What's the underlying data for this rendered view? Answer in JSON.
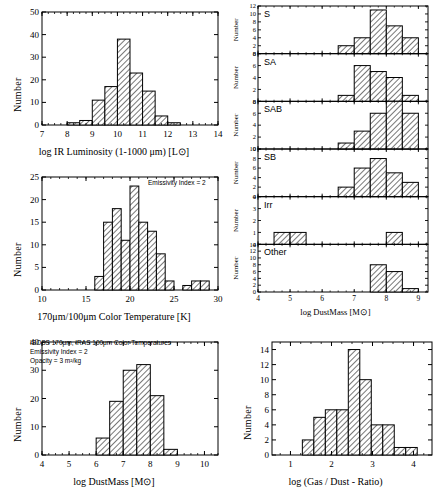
{
  "figure": {
    "background": "#ffffff",
    "ink": "#000000",
    "hatch": "diagonal-45"
  },
  "chart_data": [
    {
      "id": "ir-luminosity",
      "type": "bar",
      "title": "",
      "xlabel": "log  IR Luminosity (1-1000 μm) [L⊙]",
      "ylabel": "Number",
      "xlim": [
        7,
        14
      ],
      "ylim": [
        0,
        50
      ],
      "xticks": [
        7,
        8,
        9,
        10,
        11,
        12,
        13,
        14
      ],
      "yticks": [
        0,
        10,
        20,
        30,
        40,
        50
      ],
      "bin_width": 0.5,
      "bin_starts": [
        8.0,
        8.5,
        9.0,
        9.5,
        10.0,
        10.5,
        11.0,
        11.5,
        12.0
      ],
      "values": [
        1,
        2,
        11,
        17,
        38,
        23,
        15,
        4,
        1
      ],
      "grid": false,
      "annotations": []
    },
    {
      "id": "color-temperature",
      "type": "bar",
      "title": "",
      "xlabel": "170μm/100μm Color Temperature [K]",
      "ylabel": "Number",
      "xlim": [
        10,
        30
      ],
      "ylim": [
        0,
        25
      ],
      "xticks": [
        10,
        15,
        20,
        25,
        30
      ],
      "yticks": [
        0,
        5,
        10,
        15,
        20,
        25
      ],
      "bin_width": 1,
      "bin_starts": [
        16,
        17,
        18,
        19,
        20,
        21,
        22,
        23,
        24,
        25,
        26,
        27,
        28
      ],
      "values": [
        3,
        15,
        18,
        11,
        23,
        15,
        13,
        8,
        2,
        0,
        1,
        2,
        2
      ],
      "grid": false,
      "annotations": [
        "Emissivity Index = 2"
      ]
    },
    {
      "id": "dustmass-all",
      "type": "bar",
      "title": "",
      "xlabel": "log  DustMass  [M⊙]",
      "ylabel": "Number",
      "xlim": [
        4,
        10.5
      ],
      "ylim": [
        0,
        40
      ],
      "xticks": [
        4,
        5,
        6,
        7,
        8,
        9,
        10
      ],
      "yticks": [
        0,
        10,
        20,
        30,
        40
      ],
      "bin_width": 0.5,
      "bin_starts": [
        6.0,
        6.5,
        7.0,
        7.5,
        8.0,
        8.5
      ],
      "values": [
        6,
        19,
        30,
        32,
        21,
        2
      ],
      "grid": false,
      "annotations": [
        "ISOSS 170μm, IRAS 100μm Color Temperatures",
        "Emissivity Index = 2",
        "Opacity = 3 m²/kg"
      ]
    },
    {
      "id": "dustmass-by-type",
      "type": "bar",
      "xlabel": "log  DustMass  [M⊙]",
      "ylabel": "Number",
      "xlim": [
        4,
        9.3
      ],
      "xticks": [
        4,
        5,
        6,
        7,
        8,
        9
      ],
      "bin_width": 0.5,
      "grid": false,
      "subpanels": [
        {
          "label": "S",
          "ylim": [
            0,
            12
          ],
          "yticks": [
            0,
            2,
            4,
            6,
            8,
            10,
            12
          ],
          "bin_starts": [
            6.5,
            7.0,
            7.5,
            8.0,
            8.5
          ],
          "values": [
            2,
            4,
            11,
            7,
            4
          ]
        },
        {
          "label": "SA",
          "ylim": [
            0,
            8
          ],
          "yticks": [
            0,
            2,
            4,
            6,
            8
          ],
          "bin_starts": [
            6.5,
            7.0,
            7.5,
            8.0,
            8.5
          ],
          "values": [
            1,
            6,
            5,
            4,
            1
          ]
        },
        {
          "label": "SAB",
          "ylim": [
            0,
            8
          ],
          "yticks": [
            0,
            2,
            4,
            6,
            8
          ],
          "bin_starts": [
            6.5,
            7.0,
            7.5,
            8.0,
            8.5
          ],
          "values": [
            1,
            3,
            6,
            8,
            6,
            1
          ]
        },
        {
          "label": "SB",
          "ylim": [
            0,
            10
          ],
          "yticks": [
            0,
            2,
            4,
            6,
            8,
            10
          ],
          "bin_starts": [
            6.5,
            7.0,
            7.5,
            8.0,
            8.5
          ],
          "values": [
            2,
            6,
            8,
            5,
            3
          ]
        },
        {
          "label": "Irr",
          "ylim": [
            0,
            4
          ],
          "yticks": [
            0,
            1,
            2,
            3,
            4
          ],
          "bin_starts": [
            4.5,
            5.0,
            8.0
          ],
          "values": [
            1,
            1,
            1
          ]
        },
        {
          "label": "Other",
          "ylim": [
            0,
            14
          ],
          "yticks": [
            0,
            2,
            4,
            6,
            8,
            10,
            12,
            14
          ],
          "bin_starts": [
            7.5,
            8.0,
            8.5
          ],
          "values": [
            8,
            6,
            1
          ]
        }
      ]
    },
    {
      "id": "gas-dust-ratio",
      "type": "bar",
      "title": "",
      "xlabel": "log (Gas / Dust - Ratio)",
      "ylabel": "Number",
      "xlim": [
        0.55,
        4.45
      ],
      "ylim": [
        0,
        15
      ],
      "xticks": [
        1,
        2,
        3,
        4
      ],
      "yticks": [
        0,
        2,
        4,
        6,
        8,
        10,
        12,
        14
      ],
      "bin_width": 0.28,
      "bin_starts": [
        1.29,
        1.57,
        1.85,
        2.13,
        2.41,
        2.69,
        2.97,
        3.25,
        3.53
      ],
      "values": [
        2,
        5,
        6,
        6,
        14,
        10,
        4,
        4,
        1
      ],
      "extra_bins": [
        {
          "start": 3.53,
          "value": 1
        }
      ],
      "grid": false,
      "annotations": []
    }
  ]
}
